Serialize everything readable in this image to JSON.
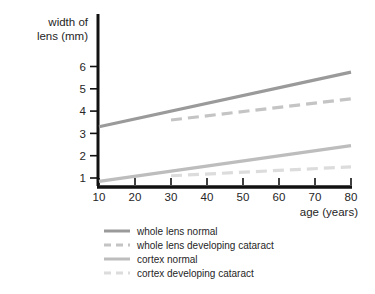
{
  "chart_data": {
    "type": "line",
    "title": "",
    "xlabel": "age (years)",
    "ylabel": "width of lens (mm)",
    "ylabel_line1": "width of",
    "ylabel_line2": "lens (mm)",
    "xlim": [
      10,
      80
    ],
    "ylim": [
      0,
      6.6
    ],
    "xticks": [
      10,
      20,
      30,
      40,
      50,
      60,
      70,
      80
    ],
    "xtick_labels": [
      "10",
      "20",
      "30",
      "40",
      "50",
      "60",
      "70",
      "80"
    ],
    "yticks": [
      1,
      2,
      3,
      4,
      5,
      6
    ],
    "ytick_labels": [
      "1",
      "2",
      "3",
      "4",
      "5",
      "6"
    ],
    "grid": false,
    "legend_position": "below",
    "series": [
      {
        "name": "whole lens normal",
        "style": "solid",
        "color": "#9a9a9a",
        "x": [
          10,
          80
        ],
        "values": [
          3.3,
          5.75
        ]
      },
      {
        "name": "whole lens developing cataract",
        "style": "dashed",
        "color": "#c4c4c4",
        "x": [
          30,
          80
        ],
        "values": [
          3.6,
          4.55
        ]
      },
      {
        "name": "cortex normal",
        "style": "solid",
        "color": "#bdbdbd",
        "x": [
          10,
          80
        ],
        "values": [
          0.85,
          2.45
        ]
      },
      {
        "name": "cortex developing cataract",
        "style": "dashed",
        "color": "#dcdcdc",
        "x": [
          30,
          80
        ],
        "values": [
          1.1,
          1.5
        ]
      }
    ]
  },
  "legend": {
    "entries": [
      {
        "label": "whole lens normal"
      },
      {
        "label": "whole lens developing cataract"
      },
      {
        "label": "cortex normal"
      },
      {
        "label": "cortex developing cataract"
      }
    ]
  },
  "colors": {
    "axis": "#111111",
    "text": "#262626",
    "background": "#ffffff",
    "whole_lens_normal": "#9a9a9a",
    "whole_lens_cataract": "#c4c4c4",
    "cortex_normal": "#bdbdbd",
    "cortex_cataract": "#dcdcdc"
  }
}
